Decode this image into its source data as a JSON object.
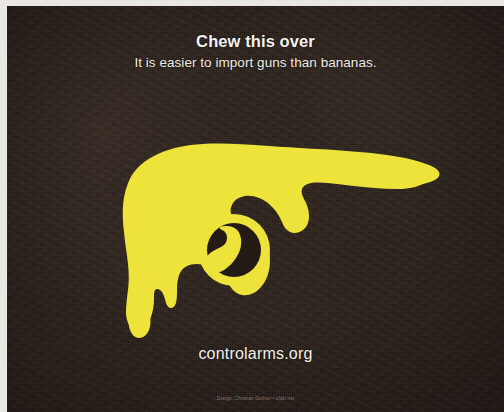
{
  "poster": {
    "headline": "Chew this over",
    "subhead": "It is easier to import guns than bananas.",
    "url": "controlarms.org",
    "credit": "Design: Christian Guthier • ofdkt.net",
    "colors": {
      "background": "#241b17",
      "artwork_yellow": "#ede33a",
      "headline_text": "#f4f2ef",
      "subhead_text": "#eeece8",
      "url_text": "#f2f0ec",
      "credit_text": "#8d8378",
      "scan_margin": "#e9e7e2"
    },
    "artwork": {
      "name": "banana-revolver-silhouette",
      "description": "Yellow silhouette of a banana shaped like a revolver"
    }
  }
}
